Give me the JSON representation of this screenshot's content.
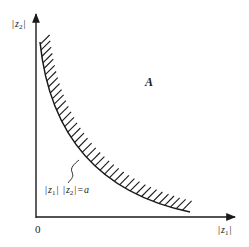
{
  "diagram": {
    "y_axis_label": {
      "bar_left": "|",
      "var": "z",
      "sub": "2",
      "bar_right": "|"
    },
    "x_axis_label": {
      "bar_left": "|",
      "var": "z",
      "sub": "1",
      "bar_right": "|"
    },
    "origin_label": "0",
    "region_label": "A",
    "curve_label": {
      "part1_bar": "|",
      "part1_var": "z",
      "part1_sub": "1",
      "part1_bar2": "|",
      "part2_bar": " |",
      "part2_var": "z",
      "part2_sub": "2",
      "part2_bar2": "|",
      "equals": "=",
      "const": "a"
    },
    "colors": {
      "ink": "#1a1a1a",
      "background": "#ffffff"
    }
  }
}
